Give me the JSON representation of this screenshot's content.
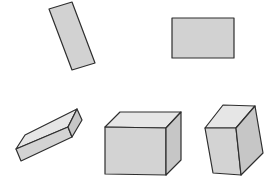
{
  "colors": {
    "background": "#ffffff",
    "outline": "#2e2e2e",
    "flat_fill": "#d2d2d2",
    "top_face": "#e6e6e6",
    "front_face": "#d3d3d3",
    "side_face": "#c6c6c6"
  },
  "shapes": [
    {
      "id": "tilted-rectangle",
      "kind": "2d-rectangle",
      "orientation": "tilted"
    },
    {
      "id": "horizontal-rectangle",
      "kind": "2d-rectangle",
      "orientation": "horizontal"
    },
    {
      "id": "flat-prism",
      "kind": "rectangular-prism",
      "orientation": "tilted"
    },
    {
      "id": "large-cube",
      "kind": "rectangular-prism",
      "orientation": "upright"
    },
    {
      "id": "tilted-prism",
      "kind": "rectangular-prism",
      "orientation": "tilted"
    }
  ]
}
